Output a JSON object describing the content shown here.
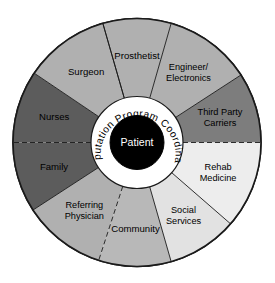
{
  "figure": {
    "name": "amputation-team-wheel",
    "type": "radial-segment-diagram"
  },
  "center": {
    "core_label": "Patient",
    "core_color": "#000000",
    "ring_label": "Amputation Program Coordinator",
    "ring_color": "#ffffff",
    "ring_text_color": "#000000"
  },
  "segments": [
    {
      "label": "Prosthetist",
      "line1": "Prosthetist",
      "line2": "",
      "color": "#b0b0b0",
      "start_deg": -106,
      "end_deg": -74,
      "divider": "solid"
    },
    {
      "label": "Engineer/Electronics",
      "line1": "Engineer/",
      "line2": "Electronics",
      "color": "#b0b0b0",
      "start_deg": -74,
      "end_deg": -33,
      "divider": "solid"
    },
    {
      "label": "Third Party Carriers",
      "line1": "Third Party",
      "line2": "Carriers",
      "color": "#7d7d7d",
      "start_deg": -33,
      "end_deg": 0,
      "divider": "solid"
    },
    {
      "label": "Rehab Medicine",
      "line1": "Rehab",
      "line2": "Medicine",
      "color": "#ededed",
      "start_deg": 0,
      "end_deg": 41,
      "divider": "dashed"
    },
    {
      "label": "Social Services",
      "line1": "Social",
      "line2": "Services",
      "color": "#e2e2e2",
      "start_deg": 41,
      "end_deg": 74,
      "divider": "solid"
    },
    {
      "label": "Community",
      "line1": "Community",
      "line2": "",
      "color": "#b8b8b8",
      "start_deg": 74,
      "end_deg": 108,
      "divider": "solid"
    },
    {
      "label": "Referring Physician",
      "line1": "Referring",
      "line2": "Physician",
      "color": "#b0b0b0",
      "start_deg": 108,
      "end_deg": 147,
      "divider": "dashed"
    },
    {
      "label": "Family",
      "line1": "Family",
      "line2": "",
      "color": "#5c5c5c",
      "start_deg": 147,
      "end_deg": 180,
      "divider": "solid"
    },
    {
      "label": "Nurses",
      "line1": "Nurses",
      "line2": "",
      "color": "#5c5c5c",
      "start_deg": 180,
      "end_deg": 214,
      "divider": "dashed"
    },
    {
      "label": "Surgeon",
      "line1": "Surgeon",
      "line2": "",
      "color": "#b0b0b0",
      "start_deg": 214,
      "end_deg": 254,
      "divider": "solid"
    }
  ],
  "colors": {
    "outline": "#1a1a1a",
    "background": "#ffffff",
    "darkest": "#5c5c5c",
    "lightest": "#ededed"
  }
}
